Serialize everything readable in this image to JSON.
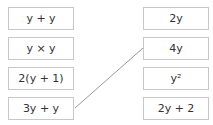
{
  "left": [
    {
      "label": "y + y"
    },
    {
      "label": "y × y"
    },
    {
      "label": "2(y + 1)"
    },
    {
      "label": "3y + y"
    }
  ],
  "right": [
    {
      "label": "2y"
    },
    {
      "label": "4y"
    },
    {
      "label": "y²"
    },
    {
      "label": "2y + 2"
    }
  ],
  "connections": [
    {
      "from": "3y + y",
      "to": "4y"
    }
  ],
  "colors": {
    "border": "#c8c8c8",
    "line": "#999999"
  }
}
